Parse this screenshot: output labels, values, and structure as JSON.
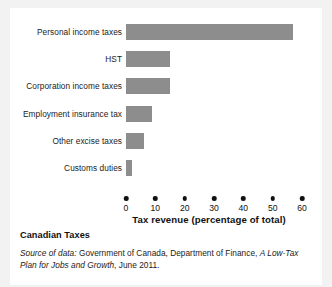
{
  "chart_data": {
    "type": "bar",
    "orientation": "horizontal",
    "title": "Canadian Taxes",
    "xlabel": "Tax revenue (percentage of total)",
    "ylabel": "",
    "xlim": [
      0,
      60
    ],
    "xticks": [
      0,
      10,
      20,
      30,
      40,
      50,
      60
    ],
    "grid": false,
    "legend": "none",
    "bar_color": "#8d8d8d",
    "categories": [
      "Personal income taxes",
      "HST",
      "Corporation income taxes",
      "Employment insurance tax",
      "Other excise taxes",
      "Customs duties"
    ],
    "values": [
      57,
      15,
      15,
      9,
      6,
      2
    ]
  },
  "caption": {
    "title": "Canadian Taxes",
    "source_lead": "Source of data:",
    "source_body_1": " Government of Canada, Department of Finance, ",
    "source_work": "A Low-Tax Plan for Jobs and Growth",
    "source_body_2": ", June 2011."
  }
}
